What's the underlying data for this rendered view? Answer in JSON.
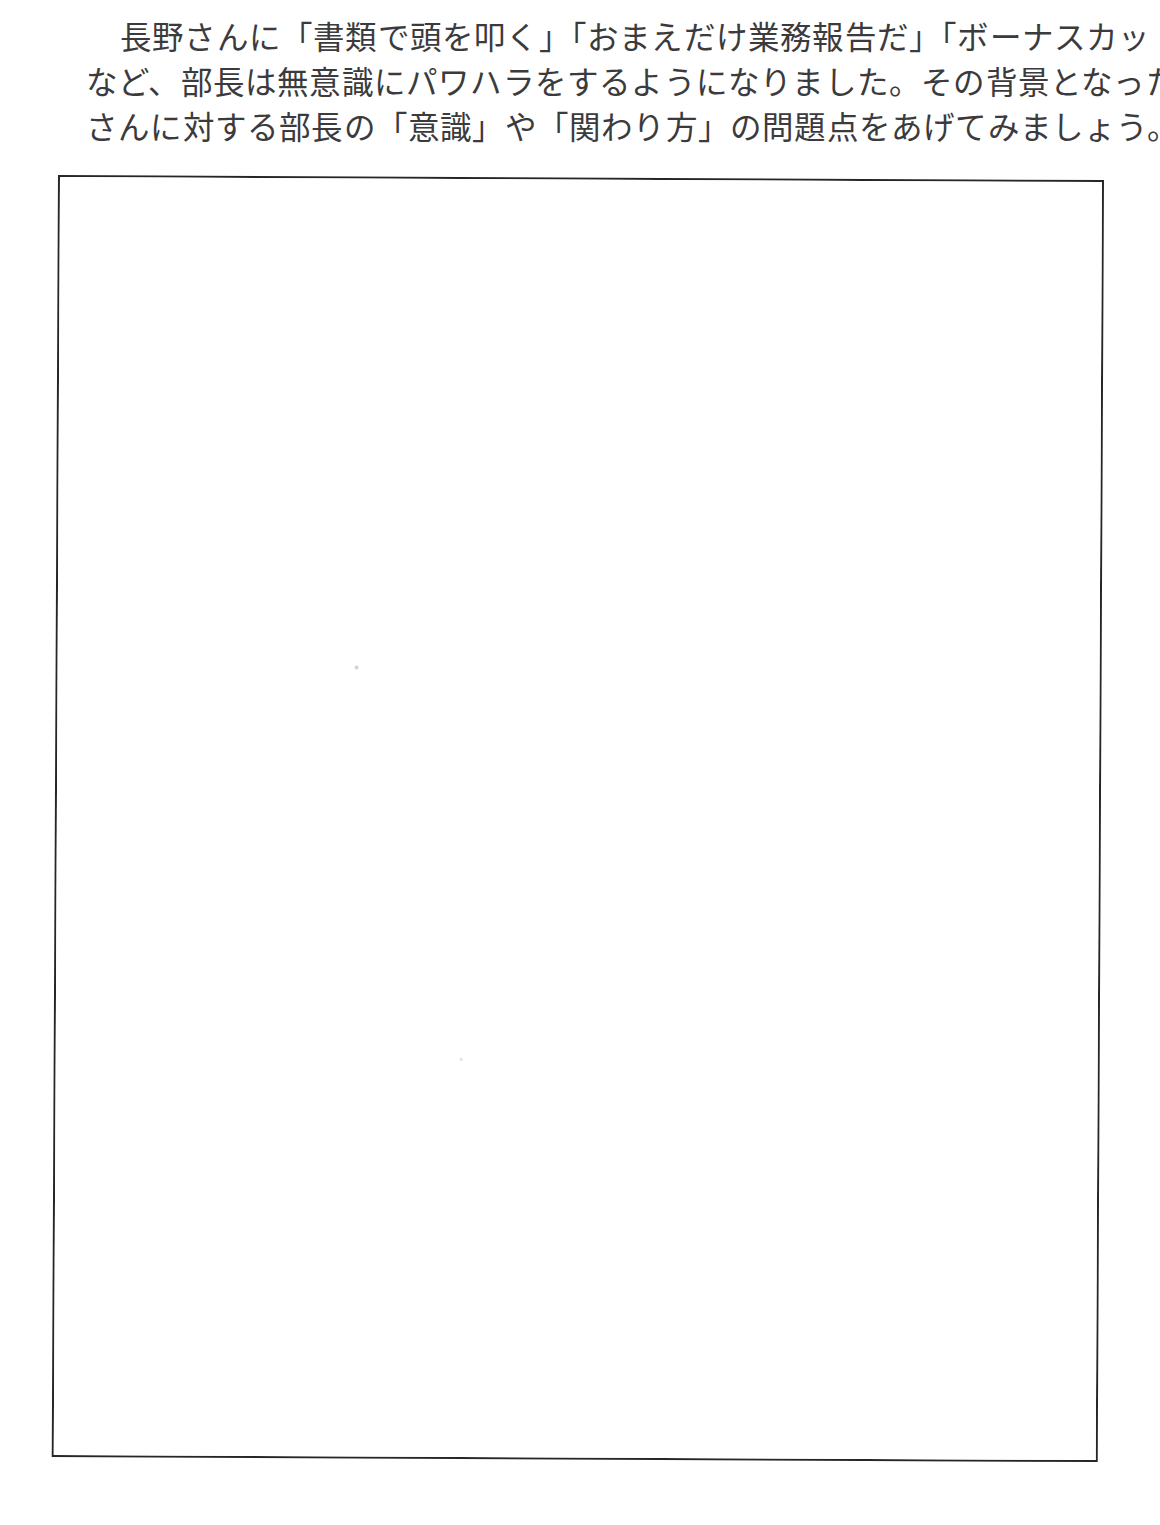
{
  "page": {
    "background_color": "#ffffff",
    "text_color": "#3b3b3d",
    "border_color": "#262629"
  },
  "passage": {
    "lines": [
      "長野さんに「書類で頭を叩く」「おまえだけ業務報告だ」「ボーナスカットだぞ」",
      "など、部長は無意識にパワハラをするようになりました。その背景となった長野",
      "さんに対する部長の「意識」や「関わり方」の問題点をあげてみましょう。"
    ],
    "full_text": "長野さんに「書類で頭を叩く」「おまえだけ業務報告だ」「ボーナスカットだぞ」など、部長は無意識にパワハラをするようになりました。その背景となった長野さんに対する部長の「意識」や「関わり方」の問題点をあげてみましょう。"
  },
  "answer_box": {
    "content": "",
    "placeholder": ""
  }
}
